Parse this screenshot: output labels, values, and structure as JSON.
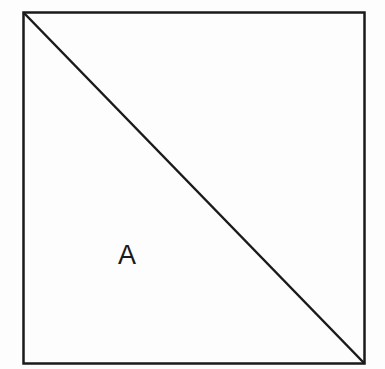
{
  "diagram": {
    "shape": "square",
    "square": {
      "x": 23.5,
      "y": 12.5,
      "width": 341,
      "height": 351
    },
    "diagonal": {
      "from": "top-left",
      "to": "bottom-right",
      "x1": 23.5,
      "y1": 12.5,
      "x2": 364.5,
      "y2": 363.5
    },
    "stroke_color": "#1a1a1a",
    "background_color": "#fdfdfd",
    "region_label": {
      "text": "A",
      "x": 118,
      "y": 242
    }
  }
}
